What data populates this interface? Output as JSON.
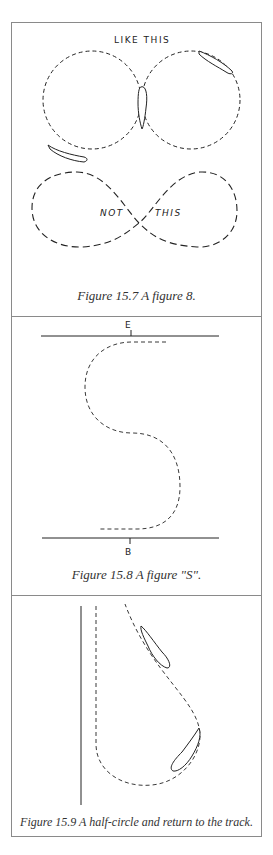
{
  "figures": [
    {
      "caption": "Figure 15.7  A figure 8.",
      "labels": {
        "top": "LIKE THIS",
        "bottom_left": "NOT",
        "bottom_right": "THIS"
      }
    },
    {
      "caption": "Figure 15.8  A figure \"S\".",
      "labels": {
        "end": "E",
        "begin": "B"
      }
    },
    {
      "caption": "Figure 15.9  A half-circle and return to the track."
    }
  ],
  "colors": {
    "line": "#222222",
    "frame": "#8a8a8a",
    "caption": "#333333"
  }
}
